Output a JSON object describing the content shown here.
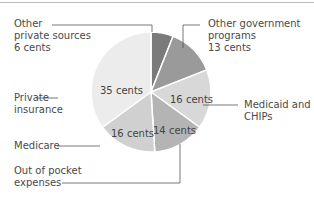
{
  "chart_data": {
    "type": "pie",
    "title": "",
    "unit": "cents",
    "categories": [
      "Other private sources",
      "Other government programs",
      "Medicaid and CHIPs",
      "Out of pocket expenses",
      "Medicare",
      "Private insurance"
    ],
    "values": [
      6,
      13,
      16,
      14,
      16,
      35
    ],
    "colors": [
      "#7a7a7a",
      "#9a9a9a",
      "#d8d8d8",
      "#b4b4b4",
      "#d0d0d0",
      "#ececec"
    ],
    "slice_labels": [
      "",
      "",
      "16 cents",
      "14 cents",
      "16 cents",
      "35 cents"
    ],
    "legend_position": "callouts"
  },
  "labels": {
    "other_private": [
      "Other",
      "private sources",
      "6 cents"
    ],
    "other_gov": [
      "Other government",
      "programs",
      "13 cents"
    ],
    "medicaid": [
      "Medicaid and",
      "CHIPs"
    ],
    "private_ins": [
      "Private",
      "insurance"
    ],
    "medicare": [
      "Medicare"
    ],
    "oop": [
      "Out of pocket",
      "expenses"
    ]
  },
  "slice_text": {
    "medicaid": "16 cents",
    "oop": "14 cents",
    "medicare": "16 cents",
    "private": "35 cents"
  }
}
